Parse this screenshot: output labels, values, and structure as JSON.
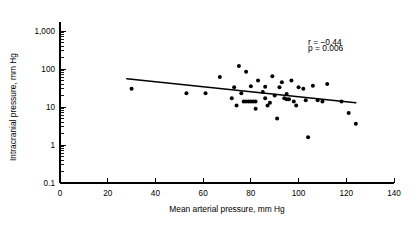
{
  "chart_data": {
    "type": "scatter",
    "title": "",
    "xlabel": "Mean arterial pressure, mm Hg",
    "ylabel": "Intracranial pressure, mm Hg",
    "xlim": [
      0,
      140
    ],
    "ylim": [
      0.1,
      1000
    ],
    "yscale": "log",
    "xscale": "linear",
    "grid": false,
    "legend": null,
    "xticks": [
      0,
      20,
      40,
      60,
      80,
      100,
      120,
      140
    ],
    "xticklabels": [
      "0",
      "20",
      "40",
      "60",
      "80",
      "100",
      "120",
      "140"
    ],
    "yticks": [
      0.1,
      1,
      10,
      100,
      1000
    ],
    "yticklabels": [
      "0.1",
      "1",
      "10",
      "100",
      "1,000"
    ],
    "annotations": [
      {
        "text": "r = −0.44",
        "x": 104,
        "y": 430
      },
      {
        "text": "p = 0.006",
        "x": 104,
        "y": 300
      }
    ],
    "correlation_r": -0.44,
    "p_value": 0.006,
    "fit_line": {
      "type": "linear-on-log-y",
      "x_start": 28,
      "y_start": 55,
      "x_end": 124,
      "y_end": 13
    },
    "points": [
      {
        "x": 30,
        "y": 30
      },
      {
        "x": 53,
        "y": 23
      },
      {
        "x": 61,
        "y": 23
      },
      {
        "x": 67,
        "y": 62
      },
      {
        "x": 72,
        "y": 17
      },
      {
        "x": 73,
        "y": 33
      },
      {
        "x": 74,
        "y": 11
      },
      {
        "x": 75,
        "y": 120
      },
      {
        "x": 76,
        "y": 23
      },
      {
        "x": 77,
        "y": 14
      },
      {
        "x": 78,
        "y": 14
      },
      {
        "x": 79,
        "y": 14
      },
      {
        "x": 80,
        "y": 14
      },
      {
        "x": 81,
        "y": 14
      },
      {
        "x": 82,
        "y": 14
      },
      {
        "x": 78,
        "y": 85
      },
      {
        "x": 80,
        "y": 35
      },
      {
        "x": 82,
        "y": 9
      },
      {
        "x": 83,
        "y": 50
      },
      {
        "x": 85,
        "y": 25
      },
      {
        "x": 86,
        "y": 17
      },
      {
        "x": 86,
        "y": 34
      },
      {
        "x": 87,
        "y": 11
      },
      {
        "x": 88,
        "y": 13
      },
      {
        "x": 89,
        "y": 64
      },
      {
        "x": 90,
        "y": 20
      },
      {
        "x": 91,
        "y": 5
      },
      {
        "x": 92,
        "y": 33
      },
      {
        "x": 93,
        "y": 45
      },
      {
        "x": 94,
        "y": 17
      },
      {
        "x": 95,
        "y": 22
      },
      {
        "x": 95,
        "y": 16
      },
      {
        "x": 96,
        "y": 16
      },
      {
        "x": 97,
        "y": 50
      },
      {
        "x": 98,
        "y": 14
      },
      {
        "x": 99,
        "y": 11
      },
      {
        "x": 100,
        "y": 33
      },
      {
        "x": 102,
        "y": 30
      },
      {
        "x": 103,
        "y": 15
      },
      {
        "x": 104,
        "y": 1.6
      },
      {
        "x": 106,
        "y": 36
      },
      {
        "x": 108,
        "y": 15
      },
      {
        "x": 110,
        "y": 14
      },
      {
        "x": 112,
        "y": 40
      },
      {
        "x": 118,
        "y": 14
      },
      {
        "x": 121,
        "y": 7
      },
      {
        "x": 124,
        "y": 3.6
      }
    ]
  }
}
